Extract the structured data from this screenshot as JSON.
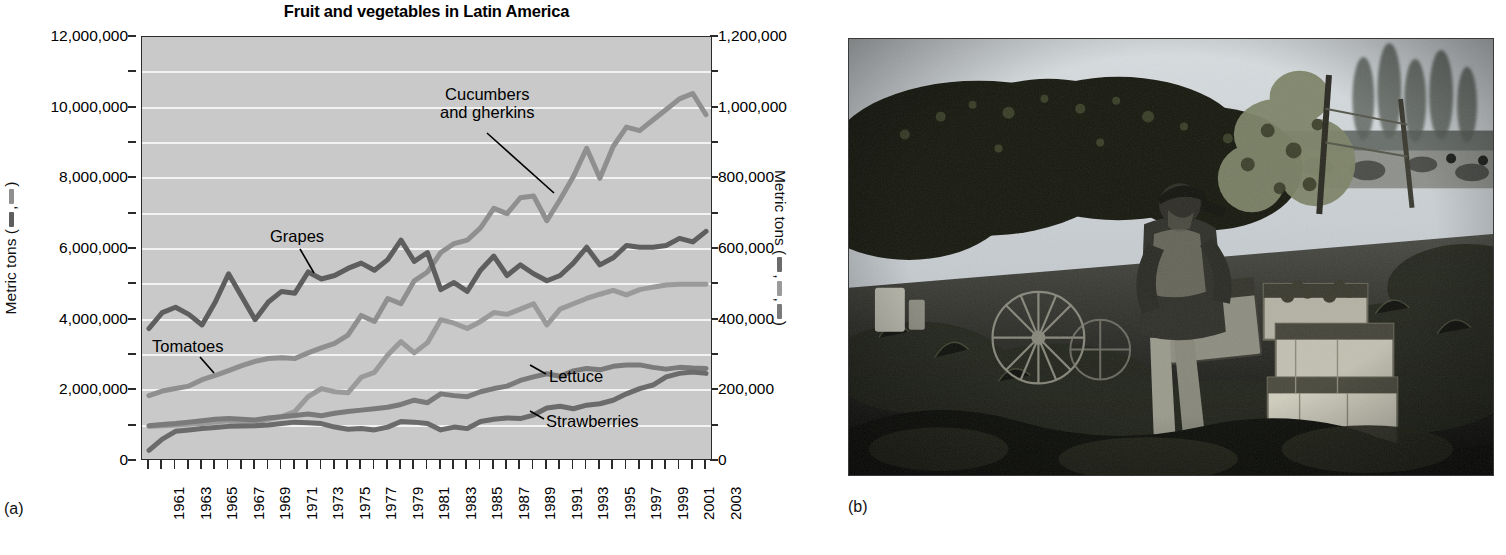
{
  "figure": {
    "panel_a_label": "(a)",
    "panel_b_label": "(b)"
  },
  "chart_data": {
    "type": "line",
    "title": "Fruit and vegetables in Latin America",
    "xlabel": "",
    "ylabel_left": "Metric tons",
    "ylabel_right": "Metric tons",
    "ylim_left": [
      0,
      12000000
    ],
    "ylim_right": [
      0,
      1200000
    ],
    "grid": true,
    "legend_position": "inline-annotations",
    "left_axis_ticks": [
      "0",
      "2,000,000",
      "4,000,000",
      "6,000,000",
      "8,000,000",
      "10,000,000",
      "12,000,000"
    ],
    "left_axis_tick_values": [
      0,
      2000000,
      4000000,
      6000000,
      8000000,
      10000000,
      12000000
    ],
    "right_axis_ticks": [
      "0",
      "200,000",
      "400,000",
      "600,000",
      "800,000",
      "1,000,000",
      "1,200,000"
    ],
    "right_axis_tick_values": [
      0,
      200000,
      400000,
      600000,
      800000,
      1000000,
      1200000
    ],
    "x": [
      1961,
      1962,
      1963,
      1964,
      1965,
      1966,
      1967,
      1968,
      1969,
      1970,
      1971,
      1972,
      1973,
      1974,
      1975,
      1976,
      1977,
      1978,
      1979,
      1980,
      1981,
      1982,
      1983,
      1984,
      1985,
      1986,
      1987,
      1988,
      1989,
      1990,
      1991,
      1992,
      1993,
      1994,
      1995,
      1996,
      1997,
      1998,
      1999,
      2000,
      2001,
      2002,
      2003
    ],
    "x_tick_labels": [
      "1961",
      "1963",
      "1965",
      "1967",
      "1969",
      "1971",
      "1973",
      "1975",
      "1977",
      "1979",
      "1981",
      "1983",
      "1985",
      "1987",
      "1989",
      "1991",
      "1993",
      "1995",
      "1997",
      "1999",
      "2001",
      "2003"
    ],
    "series": [
      {
        "name": "Tomatoes",
        "axis": "left",
        "color": "#8f8f8f",
        "units": "metric tons",
        "values": [
          1850000,
          1980000,
          2050000,
          2120000,
          2300000,
          2420000,
          2560000,
          2700000,
          2820000,
          2900000,
          2920000,
          2900000,
          3060000,
          3200000,
          3330000,
          3560000,
          4120000,
          3950000,
          4600000,
          4450000,
          5100000,
          5350000,
          5900000,
          6150000,
          6250000,
          6600000,
          7150000,
          7000000,
          7450000,
          7500000,
          6800000,
          7400000,
          8050000,
          8850000,
          8000000,
          8900000,
          9450000,
          9350000,
          9650000,
          9950000,
          10250000,
          10400000,
          9800000
        ]
      },
      {
        "name": "Grapes",
        "axis": "left",
        "color": "#5e5e5e",
        "units": "metric tons",
        "values": [
          3750000,
          4200000,
          4350000,
          4150000,
          3850000,
          4500000,
          5300000,
          4650000,
          4000000,
          4500000,
          4800000,
          4750000,
          5350000,
          5150000,
          5250000,
          5450000,
          5600000,
          5400000,
          5700000,
          6250000,
          5650000,
          5900000,
          4850000,
          5050000,
          4800000,
          5400000,
          5800000,
          5250000,
          5550000,
          5300000,
          5100000,
          5250000,
          5600000,
          6050000,
          5550000,
          5750000,
          6100000,
          6050000,
          6050000,
          6100000,
          6300000,
          6200000,
          6500000
        ]
      },
      {
        "name": "Cucumbers and gherkins",
        "axis": "right",
        "color": "#9a9a9a",
        "units": "metric tons",
        "values": [
          98000,
          100000,
          102000,
          104000,
          106000,
          110000,
          114000,
          112000,
          110000,
          118000,
          126000,
          140000,
          182000,
          205000,
          196000,
          193000,
          237000,
          251000,
          300000,
          338000,
          306000,
          335000,
          400000,
          390000,
          375000,
          395000,
          420000,
          415000,
          430000,
          445000,
          385000,
          430000,
          445000,
          460000,
          472000,
          483000,
          470000,
          485000,
          492000,
          498000,
          500000,
          500000,
          500000
        ]
      },
      {
        "name": "Lettuce",
        "axis": "right",
        "color": "#7a7a7a",
        "units": "metric tons",
        "values": [
          100000,
          103000,
          106000,
          110000,
          114000,
          118000,
          120000,
          118000,
          116000,
          122000,
          125000,
          129000,
          133000,
          128000,
          135000,
          140000,
          144000,
          148000,
          152000,
          160000,
          172000,
          165000,
          190000,
          185000,
          182000,
          196000,
          205000,
          212000,
          228000,
          238000,
          247000,
          240000,
          255000,
          262000,
          258000,
          268000,
          272000,
          272000,
          265000,
          260000,
          265000,
          263000,
          262000
        ]
      },
      {
        "name": "Strawberries",
        "axis": "right",
        "color": "#6b6b6b",
        "units": "metric tons",
        "values": [
          30000,
          62000,
          84000,
          88000,
          92000,
          95000,
          98000,
          99000,
          100000,
          102000,
          106000,
          110000,
          108000,
          106000,
          96000,
          90000,
          92000,
          88000,
          96000,
          112000,
          110000,
          106000,
          88000,
          96000,
          92000,
          112000,
          118000,
          122000,
          120000,
          130000,
          150000,
          155000,
          148000,
          158000,
          162000,
          172000,
          190000,
          205000,
          215000,
          238000,
          248000,
          252000,
          248000
        ]
      }
    ],
    "annotations": [
      {
        "text_line1": "Cucumbers",
        "text_line2": "and gherkins",
        "name": "cucumbers-and-gherkins"
      },
      {
        "text_line1": "Grapes",
        "text_line2": "",
        "name": "grapes"
      },
      {
        "text_line1": "Tomatoes",
        "text_line2": "",
        "name": "tomatoes"
      },
      {
        "text_line1": "Lettuce",
        "text_line2": "",
        "name": "lettuce"
      },
      {
        "text_line1": "Strawberries",
        "text_line2": "",
        "name": "strawberries"
      }
    ]
  },
  "photo": {
    "description": "Worker harvesting grapes into crates in a vineyard",
    "alt": "grape-harvest-photo"
  }
}
